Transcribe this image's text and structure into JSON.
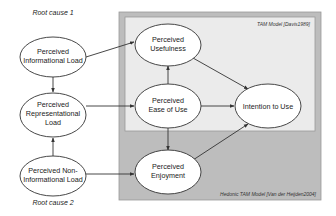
{
  "diagram": {
    "root_causes": {
      "cause1": "Root cause 1",
      "cause2": "Root cause 2"
    },
    "boxes": {
      "tam": {
        "label": "TAM Model [Davis1989]",
        "fill": "#e8e8e8"
      },
      "hedonic": {
        "label": "Hedonic TAM Model [Van der Heijden2004]",
        "fill": "#bdbdbd"
      }
    },
    "nodes": {
      "informational_load": {
        "line1": "Perceived",
        "line2": "Informational Load"
      },
      "representational_load": {
        "line1": "Perceived",
        "line2": "Representational",
        "line3": "Load"
      },
      "non_informational_load": {
        "line1": "Perceived Non-",
        "line2": "Informational Load"
      },
      "usefulness": {
        "line1": "Perceived",
        "line2": "Usefulness"
      },
      "ease_of_use": {
        "line1": "Perceived",
        "line2": "Ease of Use"
      },
      "intention": {
        "line1": "Intention to Use"
      },
      "enjoyment": {
        "line1": "Perceived",
        "line2": "Enjoyment"
      }
    },
    "edges": [
      {
        "from": "informational_load",
        "to": "representational_load"
      },
      {
        "from": "non_informational_load",
        "to": "representational_load"
      },
      {
        "from": "informational_load",
        "to": "usefulness"
      },
      {
        "from": "representational_load",
        "to": "ease_of_use"
      },
      {
        "from": "non_informational_load",
        "to": "enjoyment"
      },
      {
        "from": "ease_of_use",
        "to": "usefulness"
      },
      {
        "from": "ease_of_use",
        "to": "intention"
      },
      {
        "from": "usefulness",
        "to": "intention"
      },
      {
        "from": "ease_of_use",
        "to": "enjoyment"
      },
      {
        "from": "enjoyment",
        "to": "intention"
      }
    ]
  }
}
